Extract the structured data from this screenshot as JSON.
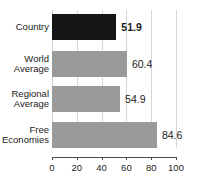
{
  "chart_data": {
    "type": "bar",
    "orientation": "horizontal",
    "title": "",
    "xlabel": "",
    "ylabel": "",
    "xlim": [
      0,
      100
    ],
    "grid": true,
    "legend": false,
    "categories": [
      "Country",
      "World Average",
      "Regional Average",
      "Free Economies"
    ],
    "values": [
      51.9,
      60.4,
      54.9,
      84.6
    ],
    "value_labels": [
      "51.9",
      "60.4",
      "54.9",
      "84.6"
    ],
    "tick_labels": [
      "0",
      "20",
      "40",
      "60",
      "80",
      "100"
    ],
    "ticks": [
      0,
      20,
      40,
      60,
      80,
      100
    ],
    "bars": [
      {
        "category_lines": [
          "Country"
        ],
        "value": 51.9,
        "value_label": "51.9",
        "color": "#161616",
        "emphasis": true
      },
      {
        "category_lines": [
          "World",
          "Average"
        ],
        "value": 60.4,
        "value_label": "60.4",
        "color": "#9a9a9a",
        "emphasis": false
      },
      {
        "category_lines": [
          "Regional",
          "Average"
        ],
        "value": 54.9,
        "value_label": "54.9",
        "color": "#9a9a9a",
        "emphasis": false
      },
      {
        "category_lines": [
          "Free",
          "Economies"
        ],
        "value": 84.6,
        "value_label": "84.6",
        "color": "#9a9a9a",
        "emphasis": false
      }
    ],
    "colors": {
      "country_bar": "#161616",
      "reference_bar": "#9a9a9a",
      "gridline": "#d6d6d6",
      "axis": "#4a4a4a",
      "text": "#1b1b1b",
      "background": "#ffffff"
    }
  }
}
